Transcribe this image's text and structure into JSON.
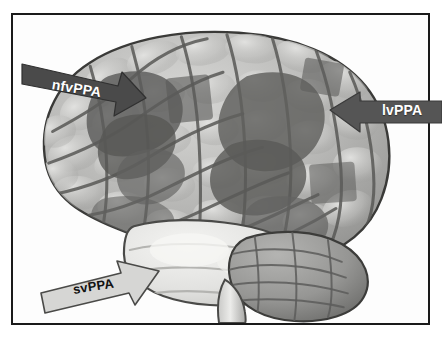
{
  "figure": {
    "kind": "brain-lateral-view-diagram",
    "frame": {
      "border_color": "#1a1a1a",
      "background": "#fdfdfd"
    },
    "brain": {
      "alt": "Left lateral view of a human brain, grayscale, with shaded atrophy regions",
      "view": "left lateral",
      "base_color": "#b9b9b9",
      "regions": [
        {
          "name": "inferior-frontal-gyrus-region",
          "label_ref": "nfvPPA",
          "shade": "dark-gray",
          "color": "#5d5d5d"
        },
        {
          "name": "temporo-parietal-junction-region",
          "label_ref": "lvPPA",
          "shade": "dark-gray",
          "color": "#6a6a6a"
        },
        {
          "name": "anterior-temporal-lobe-region",
          "label_ref": "svPPA",
          "shade": "light-gray",
          "color": "#e8e8e6"
        },
        {
          "name": "cerebellum",
          "label_ref": null,
          "shade": "medium-gray",
          "color": "#9a9a9a"
        },
        {
          "name": "brainstem",
          "label_ref": null,
          "shade": "light-gray",
          "color": "#d9d9d7"
        }
      ]
    },
    "callouts": [
      {
        "id": "nfvppa",
        "label": "nfvPPA",
        "arrow_fill": "#4a4a4a",
        "text_color": "#ffffff",
        "direction": "points-right",
        "points_at": "inferior-frontal-gyrus-region"
      },
      {
        "id": "lvppa",
        "label": "lvPPA",
        "arrow_fill": "#555555",
        "text_color": "#ffffff",
        "direction": "points-left",
        "points_at": "temporo-parietal-junction-region"
      },
      {
        "id": "svppa",
        "label": "svPPA",
        "arrow_fill": "#d6d6d4",
        "text_color": "#111111",
        "direction": "points-up-right",
        "points_at": "anterior-temporal-lobe-region"
      }
    ]
  }
}
